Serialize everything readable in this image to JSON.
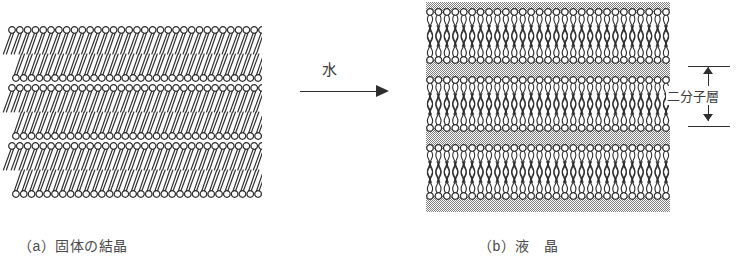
{
  "figure": {
    "title_implicit": "Lipid phase transition: solid crystal to liquid crystal",
    "arrow": {
      "label": "水",
      "icon": "right-arrow-icon",
      "direction": "right"
    },
    "panels": [
      {
        "id": "a",
        "caption": "（a）固体の結晶",
        "phase": "solid-crystal",
        "lipid_tail_style": "straight-tilted",
        "tilt_degrees": 20,
        "water_layers": false,
        "bilayer_count": 3,
        "head_row_count": 6,
        "columns": 33,
        "bounds": {
          "x": 12,
          "y": 28,
          "width": 250,
          "height": 145
        }
      },
      {
        "id": "b",
        "caption": "（b）液　晶",
        "phase": "liquid-crystal",
        "lipid_tail_style": "wavy-vertical",
        "tilt_degrees": 0,
        "water_layers": true,
        "bilayer_count": 3,
        "head_row_count": 6,
        "columns": 29,
        "bounds": {
          "x": 428,
          "y": 4,
          "width": 238,
          "height": 208
        }
      }
    ],
    "dimension_annotation": {
      "label": "二分子層",
      "measures": "bilayer-thickness",
      "arrow_style": "double-headed-vertical"
    },
    "colors": {
      "stroke": "#2e2e2e",
      "head_fill": "#ffffff",
      "water_stipple": "#8f8f8f",
      "text": "#4a4a4a",
      "background": "#ffffff"
    },
    "geometry": {
      "head_radius": 3.4,
      "head_spacing": 8.1,
      "tail_length_solid": 22,
      "tail_length_liquid": 26,
      "water_band_height": 14
    },
    "captions_position": {
      "a_x": 18,
      "a_y": 235,
      "b_x": 478,
      "b_y": 235
    }
  }
}
